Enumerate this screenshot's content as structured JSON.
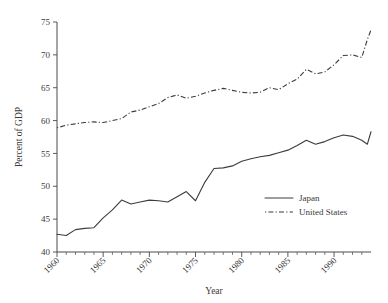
{
  "chart_data": {
    "type": "line",
    "title": "",
    "xlabel": "Year",
    "ylabel": "Percent of GDP",
    "xlim": [
      1960,
      1993
    ],
    "ylim": [
      40,
      75
    ],
    "xticks": [
      1960,
      1965,
      1970,
      1975,
      1980,
      1985,
      1990
    ],
    "xtick_labels": [
      "1960",
      "1965",
      "1970",
      "1975",
      "1980",
      "1985",
      "1990"
    ],
    "yticks": [
      40,
      45,
      50,
      55,
      60,
      65,
      70,
      75
    ],
    "ytick_labels": [
      "40",
      "45",
      "50",
      "55",
      "60",
      "65",
      "70",
      "75"
    ],
    "minor_xticks_interval": 1,
    "grid": false,
    "legend_position": "lower right",
    "x": [
      1960,
      1961,
      1962,
      1963,
      1964,
      1965,
      1966,
      1967,
      1968,
      1969,
      1970,
      1971,
      1972,
      1973,
      1974,
      1975,
      1976,
      1977,
      1978,
      1979,
      1980,
      1981,
      1982,
      1983,
      1984,
      1985,
      1986,
      1987,
      1988,
      1989,
      1990,
      1991,
      1992,
      1993
    ],
    "series": [
      {
        "name": "Japan",
        "style": "solid",
        "color": "#3c3c3c",
        "values": [
          42.7,
          42.5,
          43.4,
          43.6,
          43.7,
          45.2,
          46.4,
          47.9,
          47.3,
          47.6,
          47.9,
          47.8,
          47.6,
          48.4,
          49.2,
          47.8,
          50.6,
          52.7,
          52.8,
          53.1,
          53.8,
          54.2,
          54.5,
          54.7,
          55.1,
          55.5,
          56.2,
          57.0,
          56.4,
          56.8,
          57.4,
          57.8,
          57.6,
          57.0
        ]
      },
      {
        "name": "United States",
        "style": "dashdot",
        "color": "#3c3c3c",
        "values": [
          58.9,
          59.3,
          59.5,
          59.7,
          59.8,
          59.7,
          60.0,
          60.3,
          61.3,
          61.6,
          62.1,
          62.6,
          63.5,
          63.9,
          63.4,
          63.7,
          64.2,
          64.6,
          64.9,
          64.6,
          64.3,
          64.2,
          64.3,
          65.0,
          64.7,
          65.6,
          66.3,
          67.8,
          67.1,
          67.4,
          68.5,
          69.9,
          70.0,
          69.6
        ]
      }
    ],
    "series_extra_points": {
      "Japan": [
        [
          1993.6,
          56.4
        ],
        [
          1994.0,
          58.3
        ]
      ],
      "United States": [
        [
          1993.6,
          72.3
        ],
        [
          1994.0,
          73.8
        ]
      ]
    }
  },
  "legend": {
    "entries": [
      {
        "label": "Japan",
        "style": "solid"
      },
      {
        "label": "United States",
        "style": "dashdot"
      }
    ]
  }
}
